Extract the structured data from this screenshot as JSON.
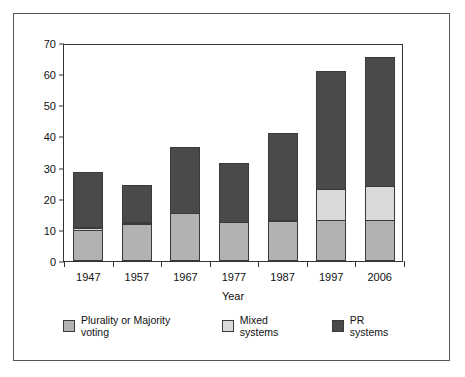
{
  "chart_data": {
    "type": "bar",
    "stacked": true,
    "title": "",
    "xlabel": "Year",
    "ylabel": "",
    "categories": [
      "1947",
      "1957",
      "1967",
      "1977",
      "1987",
      "1997",
      "2006"
    ],
    "series": [
      {
        "name": "Plurality or Majority voting",
        "color": "#b2b2b2",
        "values": [
          10,
          11.8,
          15.3,
          12.6,
          12.7,
          13.2,
          13.2
        ]
      },
      {
        "name": "Mixed systems",
        "color": "#d9d9d9",
        "values": [
          1,
          0.8,
          0,
          0,
          0.8,
          10.2,
          11
        ]
      },
      {
        "name": "PR systems",
        "color": "#4a4a4a",
        "values": [
          18,
          12.3,
          21.5,
          19.1,
          28.1,
          38.1,
          41.8
        ]
      }
    ],
    "totals": [
      29,
      24.9,
      36.8,
      31.7,
      41.6,
      61.5,
      66
    ],
    "ylim": [
      0,
      70
    ],
    "yticks": [
      0,
      10,
      20,
      30,
      40,
      50,
      60,
      70
    ],
    "ytick_labels": [
      "0",
      "10",
      "20",
      "30",
      "40",
      "50",
      "60",
      "70"
    ],
    "grid": false,
    "legend_position": "bottom"
  },
  "legend": {
    "items": [
      {
        "label": "Plurality or Majority voting",
        "color": "#b2b2b2"
      },
      {
        "label": "Mixed systems",
        "color": "#d9d9d9"
      },
      {
        "label": "PR systems",
        "color": "#4a4a4a"
      }
    ]
  },
  "colors": {
    "plurality": "#b2b2b2",
    "mixed": "#d9d9d9",
    "pr": "#4a4a4a",
    "axis": "#333333",
    "frame": "#555555",
    "background": "#ffffff"
  }
}
